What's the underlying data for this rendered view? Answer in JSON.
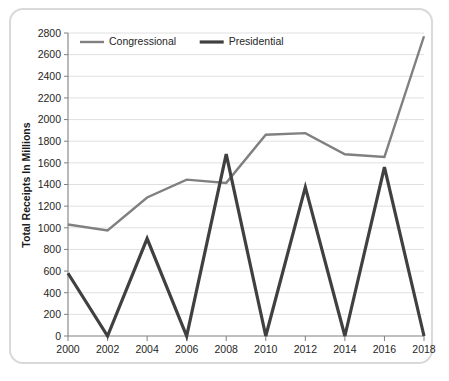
{
  "chart_data": {
    "type": "line",
    "title": "",
    "subtitle": "",
    "xlabel": "",
    "ylabel": "Total Receipts In Millions",
    "x": [
      2000,
      2002,
      2004,
      2006,
      2008,
      2010,
      2012,
      2014,
      2016,
      2018
    ],
    "categories": [
      "2000",
      "2002",
      "2004",
      "2006",
      "2008",
      "2010",
      "2012",
      "2014",
      "2016",
      "2018"
    ],
    "series": [
      {
        "name": "Congressional",
        "color": "#808080",
        "line_width": 2.4,
        "values": [
          1030,
          975,
          1280,
          1445,
          1415,
          1860,
          1875,
          1680,
          1655,
          2770
        ]
      },
      {
        "name": "Presidential",
        "color": "#404040",
        "line_width": 3.2,
        "values": [
          580,
          0,
          900,
          0,
          1680,
          0,
          1375,
          0,
          1560,
          0
        ]
      }
    ],
    "ylim": [
      0,
      2800
    ],
    "ytick_step": 200,
    "yticks": [
      0,
      200,
      400,
      600,
      800,
      1000,
      1200,
      1400,
      1600,
      1800,
      2000,
      2200,
      2400,
      2600,
      2800
    ],
    "ytick_labels": [
      "0",
      "200",
      "400",
      "600",
      "800",
      "1000",
      "1200",
      "1400",
      "1600",
      "1800",
      "2000",
      "2200",
      "2400",
      "2600",
      "2800"
    ],
    "xlim": [
      2000,
      2018
    ],
    "xticks": [
      2000,
      2002,
      2004,
      2006,
      2008,
      2010,
      2012,
      2014,
      2016,
      2018
    ],
    "xtick_labels": [
      "2000",
      "2002",
      "2004",
      "2006",
      "2008",
      "2010",
      "2012",
      "2014",
      "2016",
      "2018"
    ],
    "grid": {
      "horizontal": true,
      "vertical": false,
      "color": "#e0e0e0"
    },
    "legend": {
      "position": "top-left-inside",
      "entries": [
        "Congressional",
        "Presidential"
      ]
    },
    "annotations": []
  },
  "frame": {
    "border_color": "#d9d9d9",
    "background": "#ffffff"
  },
  "axes": {
    "line_color": "#808080"
  }
}
